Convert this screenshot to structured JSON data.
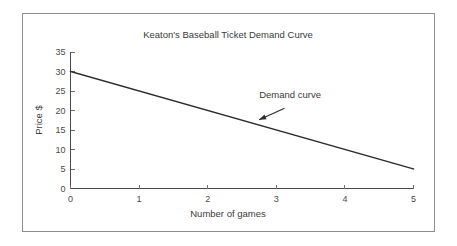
{
  "figure": {
    "border_color": "#8d8d8d",
    "background": "#ffffff"
  },
  "chart_data": {
    "type": "line",
    "title": "Keaton's Baseball Ticket Demand Curve",
    "xlabel": "Number of games",
    "ylabel": "Price $",
    "xlim": [
      0,
      5
    ],
    "ylim": [
      0,
      35
    ],
    "xticks": [
      0,
      1,
      2,
      3,
      4,
      5
    ],
    "xtick_labels": [
      "0",
      "1",
      "2",
      "3",
      "4",
      "5"
    ],
    "yticks": [
      0,
      5,
      10,
      15,
      20,
      25,
      30,
      35
    ],
    "ytick_labels": [
      "0",
      "5",
      "10",
      "15",
      "20",
      "25",
      "30",
      "35"
    ],
    "grid": false,
    "legend": false,
    "line_color": "#2b2b2b",
    "series": [
      {
        "name": "Demand curve",
        "x": [
          0,
          5
        ],
        "values": [
          30,
          5
        ],
        "points": [
          [
            0,
            30
          ],
          [
            1,
            25
          ],
          [
            2,
            20
          ],
          [
            3,
            15
          ],
          [
            4,
            10
          ],
          [
            5,
            5
          ]
        ],
        "slope": -5,
        "intercept": 30
      }
    ],
    "annotations": [
      {
        "text": "Demand curve",
        "text_x": 2.75,
        "text_y": 23.3,
        "arrow_from_x": 3.12,
        "arrow_from_y": 20.6,
        "arrow_to_x": 2.75,
        "arrow_to_y": 17.6
      }
    ]
  }
}
